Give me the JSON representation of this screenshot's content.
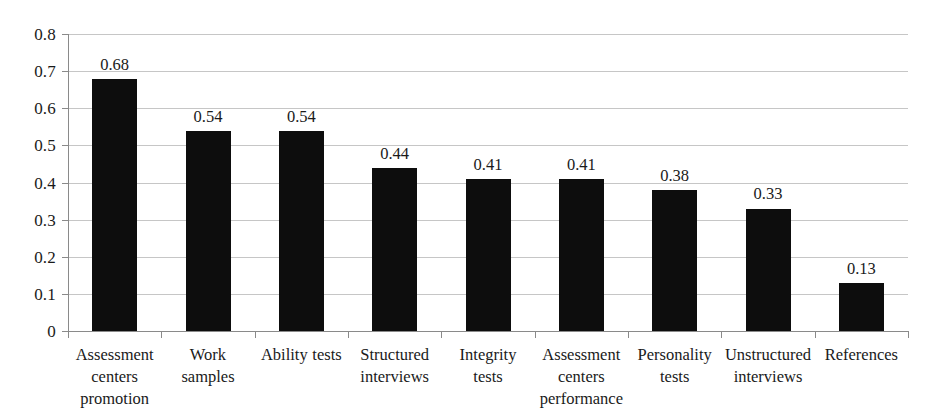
{
  "chart_data": {
    "type": "bar",
    "title": "",
    "subtitle": "",
    "xlabel": "",
    "ylabel": "",
    "ylim": [
      0,
      0.8
    ],
    "ytick_step": 0.1,
    "ytick_labels": [
      "0.8",
      "0.7",
      "0.6",
      "0.5",
      "0.4",
      "0.3",
      "0.2",
      "0.1",
      "0"
    ],
    "ytick_values": [
      0.8,
      0.7,
      0.6,
      0.5,
      0.4,
      0.3,
      0.2,
      0.1,
      0
    ],
    "grid": true,
    "grid_axis": "y",
    "legend": false,
    "legend_position": "none",
    "bar_color": "#0d0d0d",
    "gridline_color": "#c6c6c6",
    "axis_color": "#8a8a8a",
    "categories": [
      "Assessment centers promotion",
      "Work samples",
      "Ability tests",
      "Structured interviews",
      "Integrity tests",
      "Assessment centers performance",
      "Personality tests",
      "Unstructured interviews",
      "References"
    ],
    "category_lines": [
      [
        "Assessment",
        "centers",
        "promotion"
      ],
      [
        "Work",
        "samples"
      ],
      [
        "Ability tests"
      ],
      [
        "Structured",
        "interviews"
      ],
      [
        "Integrity",
        "tests"
      ],
      [
        "Assessment",
        "centers",
        "performance"
      ],
      [
        "Personality",
        "tests"
      ],
      [
        "Unstructured",
        "interviews"
      ],
      [
        "References"
      ]
    ],
    "values": [
      0.68,
      0.54,
      0.54,
      0.44,
      0.41,
      0.41,
      0.38,
      0.33,
      0.13
    ],
    "value_labels": [
      "0.68",
      "0.54",
      "0.54",
      "0.44",
      "0.41",
      "0.41",
      "0.38",
      "0.33",
      "0.13"
    ]
  }
}
